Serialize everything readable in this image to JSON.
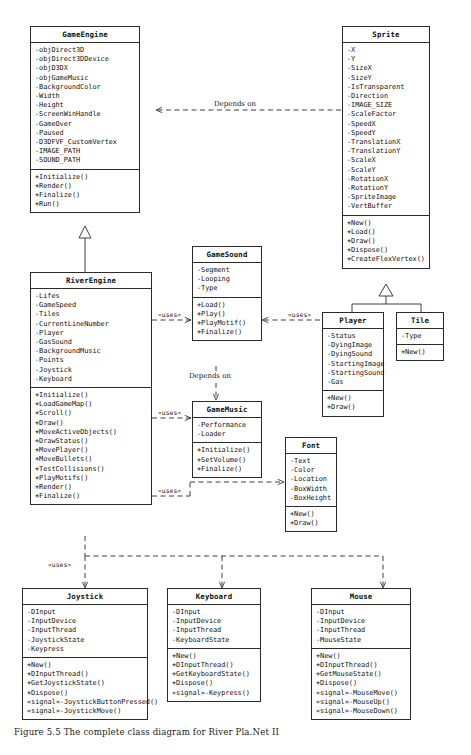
{
  "diagram": {
    "title_caption": "Figure 5.5 The complete class diagram for River Pla.Net II",
    "relationship_labels": {
      "depends_on_top": "Depends on",
      "depends_on_mid": "Depends on",
      "uses": "«uses»"
    },
    "classes": [
      {
        "id": "gameengine",
        "name": "GameEngine",
        "attributes": [
          "-objDirect3D",
          "-objDirect3DDevice",
          "-objD3DX",
          "-objGameMusic",
          "-BackgroundColor",
          "-Width",
          "-Height",
          "-ScreenWinHandle",
          "-GameOver",
          "-Paused",
          "-D3DFVF_CustomVertex",
          "-IMAGE_PATH",
          "-SOUND_PATH"
        ],
        "operations": [
          "+Initialize()",
          "+Render()",
          "+Finalize()",
          "+Run()"
        ]
      },
      {
        "id": "sprite",
        "name": "Sprite",
        "attributes": [
          "-X",
          "-Y",
          "-SizeX",
          "-SizeY",
          "-IsTransparent",
          "-Direction",
          "-IMAGE_SIZE",
          "-ScaleFactor",
          "-SpeedX",
          "-SpeedY",
          "-TranslationX",
          "-TranslationY",
          "-ScaleX",
          "-ScaleY",
          "-RotationX",
          "-RotationY",
          "-SpriteImage",
          "-VertBuffer"
        ],
        "operations": [
          "+New()",
          "+Load()",
          "+Draw()",
          "+Dispose()",
          "+CreateFlexVertex()"
        ]
      },
      {
        "id": "riverengine",
        "name": "RiverEngine",
        "attributes": [
          "-Lifes",
          "-GameSpeed",
          "-Tiles",
          "-CurrentLineNumber",
          "-Player",
          "-GasSound",
          "-BackgroundMusic",
          "-Points",
          "-Joystick",
          "-Keyboard"
        ],
        "operations": [
          "+Initialize()",
          "+LoadGameMap()",
          "+Scroll()",
          "+Draw()",
          "+MoveActiveObjects()",
          "+DrawStatus()",
          "+MovePlayer()",
          "+MoveBullets()",
          "+TestCollisions()",
          "+PlayMotifs()",
          "+Render()",
          "+Finalize()"
        ]
      },
      {
        "id": "gamesound",
        "name": "GameSound",
        "attributes": [
          "-Segment",
          "-Looping",
          "-Type"
        ],
        "operations": [
          "+Load()",
          "+Play()",
          "+PlayMotif()",
          "+Finalize()"
        ]
      },
      {
        "id": "gamemusic",
        "name": "GameMusic",
        "attributes": [
          "-Performance",
          "-Loader"
        ],
        "operations": [
          "+Initialize()",
          "+SetVolume()",
          "+Finalize()"
        ]
      },
      {
        "id": "player",
        "name": "Player",
        "attributes": [
          "-Status",
          "-DyingImage",
          "-DyingSound",
          "-StartingImage",
          "-StartingSound",
          "-Gas"
        ],
        "operations": [
          "+New()",
          "+Draw()"
        ]
      },
      {
        "id": "tile",
        "name": "Tile",
        "attributes": [
          "-Type"
        ],
        "operations": [
          "+New()"
        ]
      },
      {
        "id": "font",
        "name": "Font",
        "attributes": [
          "-Text",
          "-Color",
          "-Location",
          "-BoxWidth",
          "-BoxHeight"
        ],
        "operations": [
          "+New()",
          "+Draw()"
        ]
      },
      {
        "id": "joystick",
        "name": "Joystick",
        "attributes": [
          "-DInput",
          "-InputDevice",
          "-InputThread",
          "-JoystickState",
          "-Keypress"
        ],
        "operations": [
          "+New()",
          "+DInputThread()",
          "+GetJoystickState()",
          "+Dispose()",
          "«signal»-JoystickButtonPressed()",
          "«signal»-JoystickMove()"
        ]
      },
      {
        "id": "keyboard",
        "name": "Keyboard",
        "attributes": [
          "-DInput",
          "-InputDevice",
          "-InputThread",
          "-KeyboardState"
        ],
        "operations": [
          "+New()",
          "+DInputThread()",
          "+GetKeyboardState()",
          "+Dispose()",
          "«signal»-Keypress()"
        ]
      },
      {
        "id": "mouse",
        "name": "Mouse",
        "attributes": [
          "-DInput",
          "-InputDevice",
          "-InputThread",
          "-MouseState"
        ],
        "operations": [
          "+New()",
          "+DInputThread()",
          "+GetMouseState()",
          "+Dispose()",
          "«signal»-MouseMove()",
          "«signal»-MouseUp()",
          "«signal»-MouseDown()"
        ]
      }
    ]
  }
}
